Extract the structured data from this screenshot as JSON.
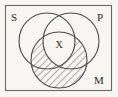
{
  "diagram": {
    "type": "venn-3",
    "background_color": "#f7f6f2",
    "stroke_color": "#4a4a4a",
    "label_color": "#2a2a2a",
    "hatch_color": "#555555",
    "universe": {
      "name": "universe-rectangle",
      "x": 5,
      "y": 5,
      "width": 107,
      "height": 86
    },
    "circles": [
      {
        "id": "S",
        "label": "S",
        "cx": 47,
        "cy": 41,
        "r": 28
      },
      {
        "id": "P",
        "label": "P",
        "cx": 71,
        "cy": 41,
        "r": 28
      },
      {
        "id": "M",
        "label": "M",
        "cx": 59,
        "cy": 60,
        "r": 28
      }
    ],
    "labels": {
      "s": "S",
      "p": "P",
      "m": "M",
      "x": "X"
    },
    "label_positions": {
      "s": {
        "x": 14,
        "y": 21
      },
      "p": {
        "x": 100,
        "y": 21
      },
      "m": {
        "x": 99,
        "y": 84
      },
      "x": {
        "x": 59,
        "y": 48
      }
    },
    "marks": [
      {
        "symbol": "X",
        "region": "S-and-P-and-M",
        "description": "X placed in the region common to all three circles"
      }
    ],
    "shading": [
      {
        "region": "M-minus-SPM",
        "style": "diagonal-hatch",
        "angle_deg": 45,
        "description": "Circle M is hatched except the central triple-overlap region containing X"
      }
    ]
  }
}
